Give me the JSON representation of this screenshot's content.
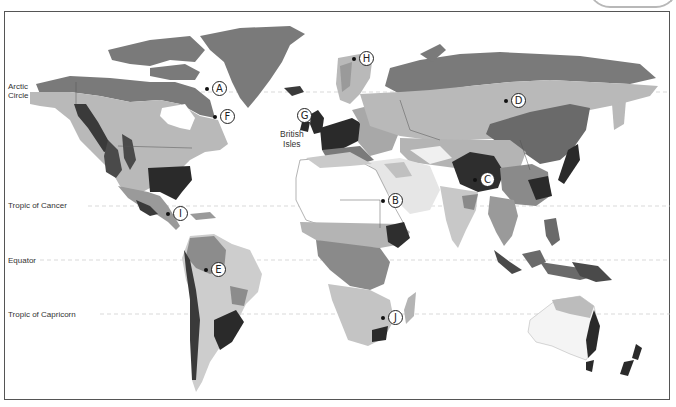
{
  "map": {
    "title": "World climate regions",
    "colors": {
      "polar": "#7a7a7a",
      "subarctic": "#b9b9b9",
      "highland": "#4a4a4a",
      "humid": "#2f2f2f",
      "temperate": "#9a9a9a",
      "dry": "#f2f2f2",
      "semiarid": "#d8d8d8",
      "tropical": "#8c8c8c",
      "water": "#ffffff",
      "border": "#666666"
    },
    "latitude_lines": [
      {
        "name": "arctic-circle",
        "label_line1": "Arctic",
        "label_line2": "Circle",
        "y": 92
      },
      {
        "name": "tropic-of-cancer",
        "label_line1": "Tropic of Cancer",
        "label_line2": "",
        "y": 205
      },
      {
        "name": "equator",
        "label_line1": "Equator",
        "label_line2": "",
        "y": 260
      },
      {
        "name": "tropic-of-capricorn",
        "label_line1": "Tropic of Capricorn",
        "label_line2": "",
        "y": 314
      }
    ],
    "region_labels": [
      {
        "name": "british-isles",
        "line1": "British",
        "line2": "Isles"
      }
    ],
    "markers": [
      {
        "letter": "A"
      },
      {
        "letter": "B"
      },
      {
        "letter": "C"
      },
      {
        "letter": "D"
      },
      {
        "letter": "E"
      },
      {
        "letter": "F"
      },
      {
        "letter": "G"
      },
      {
        "letter": "H"
      },
      {
        "letter": "I"
      },
      {
        "letter": "J"
      }
    ]
  }
}
